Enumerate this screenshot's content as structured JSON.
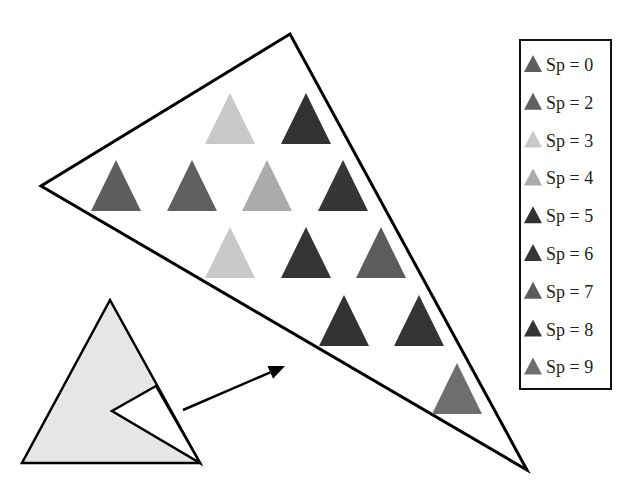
{
  "diagram": {
    "big_triangle": {
      "points": [
        [
          290,
          34
        ],
        [
          41,
          186
        ],
        [
          527,
          470
        ]
      ],
      "stroke": "#000000",
      "stroke_width": 3
    },
    "small_triangle": {
      "points": [
        [
          110,
          300
        ],
        [
          22,
          463
        ],
        [
          200,
          463
        ]
      ],
      "fill": "#e6e6e6",
      "stroke": "#000000",
      "stroke_width": 2.5,
      "notch": [
        [
          156,
          386
        ],
        [
          112,
          411
        ],
        [
          200,
          463
        ]
      ],
      "notch_fill": "#ffffff"
    },
    "arrow": {
      "from": [
        183,
        410
      ],
      "to": [
        285,
        366
      ],
      "stroke": "#000000"
    },
    "triangle_size": {
      "half_width": 25,
      "height": 51
    },
    "sp_colors": {
      "0": "#5e5e5e",
      "2": "#606060",
      "3": "#c9c9c9",
      "4": "#ababab",
      "5": "#323232",
      "6": "#363636",
      "7": "#5c5c5c",
      "8": "#343434",
      "9": "#6e6e6e"
    },
    "cells": [
      {
        "row": 1,
        "cx": 230,
        "top": 93,
        "sp": 3
      },
      {
        "row": 1,
        "cx": 306,
        "top": 93,
        "sp": 5
      },
      {
        "row": 2,
        "cx": 116,
        "top": 160,
        "sp": 0
      },
      {
        "row": 2,
        "cx": 192,
        "top": 160,
        "sp": 2
      },
      {
        "row": 2,
        "cx": 267,
        "top": 160,
        "sp": 4
      },
      {
        "row": 2,
        "cx": 343,
        "top": 160,
        "sp": 6
      },
      {
        "row": 3,
        "cx": 230,
        "top": 227,
        "sp": 3
      },
      {
        "row": 3,
        "cx": 306,
        "top": 227,
        "sp": 8
      },
      {
        "row": 3,
        "cx": 381,
        "top": 227,
        "sp": 7
      },
      {
        "row": 4,
        "cx": 344,
        "top": 295,
        "sp": 5
      },
      {
        "row": 4,
        "cx": 419,
        "top": 295,
        "sp": 8
      },
      {
        "row": 5,
        "cx": 457,
        "top": 363,
        "sp": 9
      }
    ]
  },
  "legend": {
    "box": {
      "x": 520,
      "y": 40,
      "width": 91,
      "height": 349
    },
    "items": [
      {
        "sp": "0",
        "label": "Sp = 0",
        "color": "#5e5e5e"
      },
      {
        "sp": "2",
        "label": "Sp = 2",
        "color": "#606060"
      },
      {
        "sp": "3",
        "label": "Sp = 3",
        "color": "#c9c9c9"
      },
      {
        "sp": "4",
        "label": "Sp = 4",
        "color": "#ababab"
      },
      {
        "sp": "5",
        "label": "Sp = 5",
        "color": "#323232"
      },
      {
        "sp": "6",
        "label": "Sp = 6",
        "color": "#363636"
      },
      {
        "sp": "7",
        "label": "Sp = 7",
        "color": "#5c5c5c"
      },
      {
        "sp": "8",
        "label": "Sp = 8",
        "color": "#343434"
      },
      {
        "sp": "9",
        "label": "Sp = 9",
        "color": "#6e6e6e"
      }
    ]
  }
}
